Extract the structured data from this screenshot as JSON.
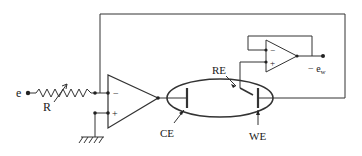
{
  "diagram": {
    "type": "circuit-schematic",
    "labels": {
      "input": "e",
      "resistor": "R",
      "counter_electrode": "CE",
      "reference_electrode": "RE",
      "working_electrode": "WE",
      "output": "− e",
      "output_subscript": "w",
      "minus_sign": "−",
      "plus_sign": "+",
      "follower_minus": "−",
      "follower_plus": "+"
    },
    "colors": {
      "wire": "#333333",
      "background": "#ffffff"
    }
  }
}
